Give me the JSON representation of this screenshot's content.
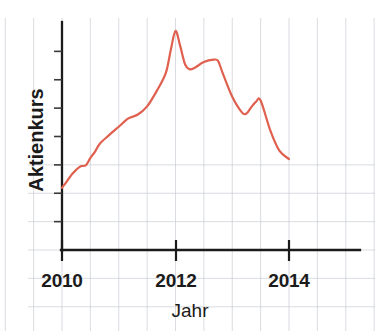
{
  "chart_data": {
    "type": "line",
    "title": "",
    "subtitle": "",
    "xlabel": "Jahr",
    "ylabel": "Aktienkurs",
    "xlim": [
      2009.8,
      2014.6
    ],
    "ylim": [
      0,
      100
    ],
    "grid": true,
    "grid_style": "graph-paper",
    "legend": "none",
    "x_tick_labels": [
      "2010",
      "2012",
      "2014"
    ],
    "x_tick_values": [
      2010,
      2012,
      2014
    ],
    "y_tick_labels": [],
    "annotations": [],
    "series": [
      {
        "name": "Aktienkurs",
        "color": "#e0604f",
        "x": [
          2010.0,
          2010.08,
          2010.17,
          2010.25,
          2010.33,
          2010.42,
          2010.5,
          2010.58,
          2010.67,
          2010.83,
          2011.0,
          2011.17,
          2011.33,
          2011.5,
          2011.67,
          2011.83,
          2011.92,
          2012.0,
          2012.08,
          2012.17,
          2012.25,
          2012.33,
          2012.5,
          2012.67,
          2012.75,
          2012.83,
          2013.0,
          2013.17,
          2013.25,
          2013.33,
          2013.42,
          2013.5,
          2013.67,
          2013.83,
          2014.0
        ],
        "y": [
          26.0,
          28.5,
          31.5,
          33.5,
          35.0,
          35.4,
          38.5,
          41.0,
          44.5,
          48.0,
          51.5,
          55.0,
          56.5,
          60.0,
          66.5,
          74.0,
          84.0,
          91.5,
          85.5,
          77.5,
          75.5,
          76.0,
          78.5,
          79.5,
          79.0,
          74.0,
          64.0,
          57.5,
          57.0,
          59.5,
          62.0,
          62.5,
          50.0,
          41.5,
          38.0
        ]
      }
    ]
  },
  "figure": {
    "x_axis_label": "Jahr",
    "y_axis_label": "Aktienkurs",
    "tick_2010": "2010",
    "tick_2012": "2012",
    "tick_2014": "2014",
    "line_color": "#e0604f",
    "grid_color": "#c9cdd4",
    "axis_color": "#1b1b1b",
    "background_color": "#ffffff"
  }
}
